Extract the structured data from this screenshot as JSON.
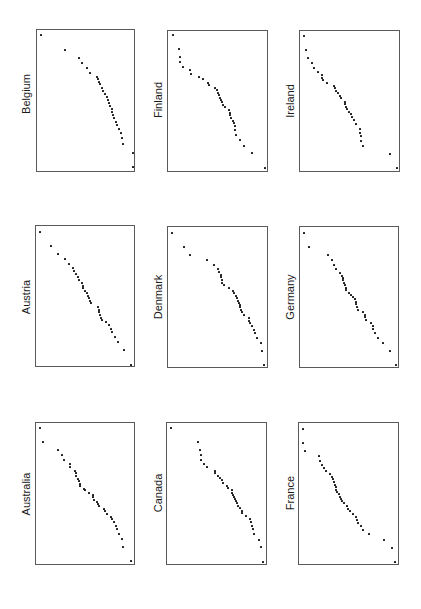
{
  "figure": {
    "orientation": "rotated 90 degrees; country labels read bottom-to-top"
  },
  "panels": [
    {
      "id": "belgium",
      "label": "Belgium",
      "box": [
        36,
        29,
        99,
        143
      ],
      "label_pos": [
        26,
        94
      ]
    },
    {
      "id": "finland",
      "label": "Finland",
      "box": [
        167,
        30,
        101,
        142
      ],
      "label_pos": [
        158,
        100
      ]
    },
    {
      "id": "ireland",
      "label": "Ireland",
      "box": [
        299,
        30,
        101,
        142
      ],
      "label_pos": [
        290,
        101
      ]
    },
    {
      "id": "austria",
      "label": "Austria",
      "box": [
        35,
        225,
        100,
        142
      ],
      "label_pos": [
        26,
        297
      ]
    },
    {
      "id": "denmark",
      "label": "Denmark",
      "box": [
        167,
        226,
        101,
        142
      ],
      "label_pos": [
        158,
        297
      ]
    },
    {
      "id": "germany",
      "label": "Germany",
      "box": [
        299,
        226,
        100,
        142
      ],
      "label_pos": [
        290,
        297
      ]
    },
    {
      "id": "australia",
      "label": "Australia",
      "box": [
        35,
        422,
        100,
        143
      ],
      "label_pos": [
        26,
        494
      ]
    },
    {
      "id": "canada",
      "label": "Canada",
      "box": [
        166,
        422,
        101,
        143
      ],
      "label_pos": [
        158,
        493
      ]
    },
    {
      "id": "france",
      "label": "France",
      "box": [
        298,
        422,
        101,
        143
      ],
      "label_pos": [
        290,
        493
      ]
    }
  ],
  "chart_data": [
    {
      "type": "scatter",
      "title": "Belgium",
      "xlabel": "",
      "ylabel": "",
      "grid": false,
      "points_local_px": [
        [
          4.3,
          5
        ],
        [
          28.3,
          20
        ],
        [
          42.3,
          28
        ],
        [
          45.3,
          33.3
        ],
        [
          50.3,
          38.3
        ],
        [
          53,
          42.7
        ],
        [
          60,
          46.7
        ],
        [
          61.3,
          49.3
        ],
        [
          62,
          51.7
        ],
        [
          62.7,
          54.3
        ],
        [
          65.3,
          58.3
        ],
        [
          66.3,
          61.3
        ],
        [
          68,
          64.3
        ],
        [
          69.7,
          67
        ],
        [
          71.3,
          70
        ],
        [
          72.3,
          73
        ],
        [
          73.3,
          76
        ],
        [
          74.7,
          78.7
        ],
        [
          75.3,
          81.7
        ],
        [
          76,
          84.7
        ],
        [
          77,
          88
        ],
        [
          78.7,
          91.7
        ],
        [
          80.3,
          95.3
        ],
        [
          82.3,
          99.3
        ],
        [
          84,
          103.3
        ],
        [
          85,
          108
        ],
        [
          86,
          114
        ],
        [
          95.7,
          122.7
        ],
        [
          95.7,
          137.3
        ]
      ]
    },
    {
      "type": "scatter",
      "title": "Finland",
      "xlabel": "",
      "ylabel": "",
      "grid": false,
      "points_local_px": [
        [
          4.7,
          4
        ],
        [
          11.3,
          18.3
        ],
        [
          11.7,
          25.7
        ],
        [
          11.7,
          31
        ],
        [
          14.7,
          35.7
        ],
        [
          22.3,
          39.3
        ],
        [
          22.7,
          43.3
        ],
        [
          31.3,
          46
        ],
        [
          35,
          48.3
        ],
        [
          39.7,
          51.7
        ],
        [
          40.7,
          54.3
        ],
        [
          47.3,
          57
        ],
        [
          48.7,
          59.3
        ],
        [
          50,
          62
        ],
        [
          51,
          64.3
        ],
        [
          52,
          66.7
        ],
        [
          52.7,
          69
        ],
        [
          53.7,
          71.3
        ],
        [
          55,
          74
        ],
        [
          57,
          76.3
        ],
        [
          61.3,
          79
        ],
        [
          61.7,
          81.7
        ],
        [
          62.3,
          84.3
        ],
        [
          63.3,
          87
        ],
        [
          65,
          89.7
        ],
        [
          66,
          92.3
        ],
        [
          67,
          95.3
        ],
        [
          67.3,
          99
        ],
        [
          68.3,
          104
        ],
        [
          72.3,
          108.7
        ],
        [
          75.7,
          114.7
        ],
        [
          84,
          122
        ],
        [
          96.7,
          136.7
        ]
      ]
    },
    {
      "type": "scatter",
      "title": "Ireland",
      "xlabel": "",
      "ylabel": "",
      "grid": false,
      "points_local_px": [
        [
          4,
          5.3
        ],
        [
          6,
          19.3
        ],
        [
          8,
          27
        ],
        [
          11.7,
          32.3
        ],
        [
          13.7,
          36.7
        ],
        [
          17.7,
          40.7
        ],
        [
          21.7,
          44
        ],
        [
          22.3,
          46.7
        ],
        [
          23,
          49.3
        ],
        [
          26.7,
          52.3
        ],
        [
          34,
          55
        ],
        [
          35.3,
          57.3
        ],
        [
          36,
          59.7
        ],
        [
          38,
          62.3
        ],
        [
          40,
          65
        ],
        [
          41.3,
          67.3
        ],
        [
          44.7,
          71
        ],
        [
          45.3,
          73.3
        ],
        [
          45.7,
          75.7
        ],
        [
          46.7,
          78.3
        ],
        [
          49,
          81
        ],
        [
          50.7,
          83.3
        ],
        [
          52.3,
          86
        ],
        [
          54.3,
          89.3
        ],
        [
          56.3,
          93.3
        ],
        [
          59.7,
          98
        ],
        [
          60.3,
          101.7
        ],
        [
          61,
          105.3
        ],
        [
          61.3,
          109.7
        ],
        [
          63.3,
          115
        ],
        [
          90.3,
          123
        ],
        [
          96.7,
          137.3
        ]
      ]
    },
    {
      "type": "scatter",
      "title": "Austria",
      "xlabel": "",
      "ylabel": "",
      "grid": false,
      "points_local_px": [
        [
          4.4,
          5.7
        ],
        [
          14.7,
          20
        ],
        [
          21.7,
          27.7
        ],
        [
          28.7,
          33.3
        ],
        [
          32.7,
          37.7
        ],
        [
          37.4,
          41.7
        ],
        [
          38.4,
          45
        ],
        [
          40.4,
          48.3
        ],
        [
          41.7,
          51
        ],
        [
          42.7,
          53.7
        ],
        [
          46,
          57
        ],
        [
          46.7,
          59.7
        ],
        [
          47.4,
          62.3
        ],
        [
          48.7,
          65
        ],
        [
          50.7,
          67.3
        ],
        [
          51.7,
          69.7
        ],
        [
          52.7,
          72.3
        ],
        [
          53.7,
          74.7
        ],
        [
          55,
          77.3
        ],
        [
          62,
          81
        ],
        [
          62.7,
          83.7
        ],
        [
          63.4,
          86.3
        ],
        [
          64.4,
          89
        ],
        [
          65.4,
          91.7
        ],
        [
          66,
          94.3
        ],
        [
          70,
          95.7
        ],
        [
          72.7,
          99.3
        ],
        [
          75,
          102.7
        ],
        [
          76.4,
          106.3
        ],
        [
          78.7,
          111
        ],
        [
          82,
          116.3
        ],
        [
          87.7,
          124
        ],
        [
          95.4,
          138.7
        ]
      ]
    },
    {
      "type": "scatter",
      "title": "Denmark",
      "xlabel": "",
      "ylabel": "",
      "grid": false,
      "points_local_px": [
        [
          4,
          5.6
        ],
        [
          15.7,
          20
        ],
        [
          21.7,
          27.6
        ],
        [
          38.7,
          33.3
        ],
        [
          46.3,
          38
        ],
        [
          49.7,
          42
        ],
        [
          51.3,
          45
        ],
        [
          52.7,
          48
        ],
        [
          53.3,
          50.3
        ],
        [
          53.7,
          53
        ],
        [
          54,
          55.6
        ],
        [
          55.7,
          58.3
        ],
        [
          61,
          61
        ],
        [
          65,
          63.6
        ],
        [
          65.7,
          66.3
        ],
        [
          68.3,
          69
        ],
        [
          69,
          71.3
        ],
        [
          70,
          73.6
        ],
        [
          70.7,
          76
        ],
        [
          71.7,
          78.3
        ],
        [
          72.3,
          80.3
        ],
        [
          73,
          83
        ],
        [
          74.3,
          85.3
        ],
        [
          76.3,
          87.6
        ],
        [
          80.7,
          91
        ],
        [
          81,
          93.6
        ],
        [
          81.7,
          96
        ],
        [
          84.3,
          99.3
        ],
        [
          85.7,
          102.6
        ],
        [
          86.7,
          106.3
        ],
        [
          88.7,
          110.6
        ],
        [
          93,
          116.3
        ],
        [
          94,
          123.6
        ],
        [
          96,
          137.6
        ]
      ]
    },
    {
      "type": "scatter",
      "title": "Germany",
      "xlabel": "",
      "ylabel": "",
      "grid": false,
      "points_local_px": [
        [
          3.6,
          6
        ],
        [
          9,
          20
        ],
        [
          28.3,
          28
        ],
        [
          32,
          33.3
        ],
        [
          34.3,
          37.6
        ],
        [
          36,
          42
        ],
        [
          40,
          45.6
        ],
        [
          41.6,
          48.6
        ],
        [
          42.6,
          51
        ],
        [
          43.3,
          53.3
        ],
        [
          44.3,
          55.6
        ],
        [
          45,
          58.3
        ],
        [
          45.6,
          60.6
        ],
        [
          46.3,
          63.3
        ],
        [
          49,
          66
        ],
        [
          51,
          67.6
        ],
        [
          53,
          70
        ],
        [
          54.6,
          72.3
        ],
        [
          55.6,
          74.6
        ],
        [
          56.3,
          77.3
        ],
        [
          57,
          80
        ],
        [
          58,
          83
        ],
        [
          63.3,
          85.3
        ],
        [
          64.6,
          87.6
        ],
        [
          65.3,
          90.3
        ],
        [
          65.6,
          93
        ],
        [
          70.6,
          95.6
        ],
        [
          73.3,
          99.3
        ],
        [
          73.3,
          102.3
        ],
        [
          74.6,
          106.3
        ],
        [
          78.3,
          111
        ],
        [
          83.3,
          116.3
        ],
        [
          90,
          123.6
        ],
        [
          96.3,
          138
        ]
      ]
    },
    {
      "type": "scatter",
      "title": "Australia",
      "xlabel": "",
      "ylabel": "",
      "grid": false,
      "points_local_px": [
        [
          4,
          5
        ],
        [
          6.7,
          19.3
        ],
        [
          21.7,
          27.3
        ],
        [
          26.3,
          32.3
        ],
        [
          28,
          37.3
        ],
        [
          33.7,
          41
        ],
        [
          34,
          44.3
        ],
        [
          39,
          47.7
        ],
        [
          39.7,
          50.3
        ],
        [
          40.3,
          53
        ],
        [
          42.3,
          55.7
        ],
        [
          43,
          58.3
        ],
        [
          43.7,
          60.7
        ],
        [
          44.3,
          63.3
        ],
        [
          48,
          65.7
        ],
        [
          48.7,
          67.3
        ],
        [
          53.3,
          69.7
        ],
        [
          56.7,
          72
        ],
        [
          57.3,
          74.3
        ],
        [
          58,
          76.7
        ],
        [
          60.7,
          78.7
        ],
        [
          62.3,
          81
        ],
        [
          63,
          83.3
        ],
        [
          68,
          85.7
        ],
        [
          69,
          88
        ],
        [
          70.7,
          90.7
        ],
        [
          75,
          93.7
        ],
        [
          75.7,
          96
        ],
        [
          78,
          99.3
        ],
        [
          80.3,
          102.7
        ],
        [
          81.3,
          106.3
        ],
        [
          83.3,
          111
        ],
        [
          86.3,
          116.3
        ],
        [
          87.3,
          123.7
        ],
        [
          95.3,
          138.3
        ]
      ]
    },
    {
      "type": "scatter",
      "title": "Canada",
      "xlabel": "",
      "ylabel": "",
      "grid": false,
      "points_local_px": [
        [
          4.4,
          5
        ],
        [
          31.4,
          19.4
        ],
        [
          32.7,
          27
        ],
        [
          33.7,
          32.4
        ],
        [
          34.4,
          37
        ],
        [
          37,
          41
        ],
        [
          40.4,
          44.4
        ],
        [
          48,
          47.7
        ],
        [
          48.4,
          50
        ],
        [
          51,
          52.7
        ],
        [
          53.4,
          55.4
        ],
        [
          54.7,
          57.4
        ],
        [
          56.4,
          60
        ],
        [
          60,
          63
        ],
        [
          60.7,
          65.4
        ],
        [
          64.7,
          67.4
        ],
        [
          65.4,
          69.7
        ],
        [
          66.4,
          71.7
        ],
        [
          67.4,
          73.7
        ],
        [
          68.4,
          75.7
        ],
        [
          69,
          78
        ],
        [
          70.4,
          80.4
        ],
        [
          71.4,
          82.7
        ],
        [
          73.4,
          85
        ],
        [
          74.7,
          87.7
        ],
        [
          75,
          90.4
        ],
        [
          79.4,
          93.4
        ],
        [
          82.7,
          96
        ],
        [
          84,
          99.4
        ],
        [
          84.7,
          102.7
        ],
        [
          85.7,
          106.4
        ],
        [
          87,
          110.7
        ],
        [
          91.7,
          116.7
        ],
        [
          94.4,
          124
        ],
        [
          96.4,
          138.7
        ]
      ]
    },
    {
      "type": "scatter",
      "title": "France",
      "xlabel": "",
      "ylabel": "",
      "grid": false,
      "points_local_px": [
        [
          3.7,
          6
        ],
        [
          4.4,
          20
        ],
        [
          6,
          28
        ],
        [
          20,
          33.3
        ],
        [
          21,
          37.7
        ],
        [
          22.7,
          41.7
        ],
        [
          25.4,
          45
        ],
        [
          27.4,
          48.3
        ],
        [
          30.7,
          51
        ],
        [
          32.7,
          53.7
        ],
        [
          34,
          56.3
        ],
        [
          35.4,
          59
        ],
        [
          36,
          61.7
        ],
        [
          36.7,
          64.3
        ],
        [
          37.4,
          66.7
        ],
        [
          38,
          69
        ],
        [
          39.7,
          71.3
        ],
        [
          41,
          73.7
        ],
        [
          42,
          76
        ],
        [
          43.4,
          78
        ],
        [
          45,
          80
        ],
        [
          48,
          83
        ],
        [
          49.4,
          85.7
        ],
        [
          50.7,
          88.3
        ],
        [
          53.7,
          91.3
        ],
        [
          56.7,
          94
        ],
        [
          58,
          96.7
        ],
        [
          58.7,
          99.7
        ],
        [
          61.7,
          103.3
        ],
        [
          64,
          107.3
        ],
        [
          70.4,
          111.3
        ],
        [
          85.4,
          117
        ],
        [
          92.7,
          124.7
        ],
        [
          96,
          139.3
        ]
      ]
    }
  ]
}
